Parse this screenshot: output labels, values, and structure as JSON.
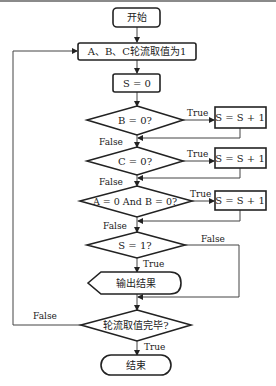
{
  "diagram": {
    "type": "flowchart",
    "colors": {
      "stroke": "#222222",
      "line": "#555555",
      "background": "#ffffff",
      "top_border": "#8a8a8a"
    },
    "nodes": {
      "start": {
        "label": "开始",
        "shape": "terminal"
      },
      "init": {
        "label": "A、B、C轮流取值为1",
        "shape": "process"
      },
      "s_zero": {
        "label": "S = 0",
        "shape": "process"
      },
      "cond_b": {
        "label": "B = 0?",
        "shape": "decision"
      },
      "inc_b": {
        "label": "S = S + 1",
        "shape": "process"
      },
      "cond_c": {
        "label": "C = 0?",
        "shape": "decision"
      },
      "inc_c": {
        "label": "S = S + 1",
        "shape": "process"
      },
      "cond_ab": {
        "label": "A = 0 And B = 0?",
        "shape": "decision"
      },
      "inc_ab": {
        "label": "S = S + 1",
        "shape": "process"
      },
      "cond_s": {
        "label": "S = 1?",
        "shape": "decision"
      },
      "output": {
        "label": "输出结果",
        "shape": "display"
      },
      "cond_done": {
        "label": "轮流取值完毕?",
        "shape": "decision"
      },
      "end": {
        "label": "结束",
        "shape": "terminal"
      }
    },
    "edge_labels": {
      "b_true": "True",
      "b_false": "False",
      "c_true": "True",
      "c_false": "False",
      "ab_true": "True",
      "ab_false": "False",
      "s_true": "True",
      "s_false": "False",
      "done_true": "True",
      "done_false": "False"
    }
  }
}
